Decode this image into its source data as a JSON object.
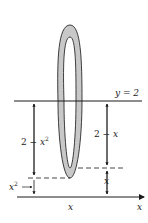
{
  "diagram": {
    "colors": {
      "line": "#1a1a1a",
      "ring_fill": "#c8c8c8",
      "ring_stroke": "#2a2a2a",
      "background": "#ffffff"
    },
    "labels": {
      "axis_line": "y = 2",
      "outer_radius": "2 − x²",
      "inner_radius": "2 − x",
      "lower_curve_height": "x²",
      "upper_curve_height": "x",
      "x_position": "x",
      "x_axis": "x"
    }
  }
}
